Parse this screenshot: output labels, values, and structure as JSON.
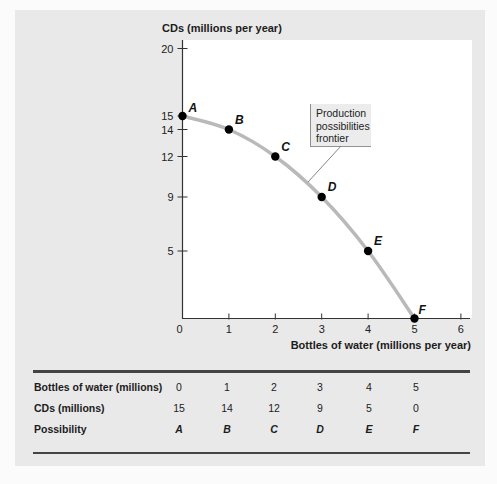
{
  "chart_data": {
    "type": "line",
    "title": "",
    "xlabel": "Bottles of water (millions per year)",
    "ylabel": "CDs (millions per year)",
    "xlim": [
      0,
      6
    ],
    "ylim": [
      0,
      20
    ],
    "x_ticks": [
      "0",
      "1",
      "2",
      "3",
      "4",
      "5",
      "6"
    ],
    "y_ticks": [
      "5",
      "9",
      "12",
      "14",
      "15",
      "20"
    ],
    "grid": false,
    "series": [
      {
        "name": "Production possibilities frontier",
        "x": [
          0,
          1,
          2,
          3,
          4,
          5
        ],
        "y": [
          15,
          14,
          12,
          9,
          5,
          0
        ],
        "point_labels": [
          "A",
          "B",
          "C",
          "D",
          "E",
          "F"
        ]
      }
    ],
    "annotations": [
      {
        "text": "Production possibilities frontier",
        "points_to": "curve between C and D"
      }
    ]
  },
  "chart": {
    "y_axis_title": "CDs (millions per year)",
    "x_axis_title": "Bottles of water (millions per year)",
    "callout_lines": [
      "Production",
      "possibilities",
      "frontier"
    ],
    "colors": {
      "panel_bg": "#e9e9e9",
      "plot_bg": "#ffffff",
      "curve": "#b9b9b9",
      "points": "#000000",
      "axis": "#333333"
    }
  },
  "table": {
    "rows": [
      {
        "label": "Bottles of water (millions)",
        "values": [
          "0",
          "1",
          "2",
          "3",
          "4",
          "5"
        ]
      },
      {
        "label": "CDs (millions)",
        "values": [
          "15",
          "14",
          "12",
          "9",
          "5",
          "0"
        ]
      },
      {
        "label": "Possibility",
        "values": [
          "A",
          "B",
          "C",
          "D",
          "E",
          "F"
        ]
      }
    ]
  }
}
